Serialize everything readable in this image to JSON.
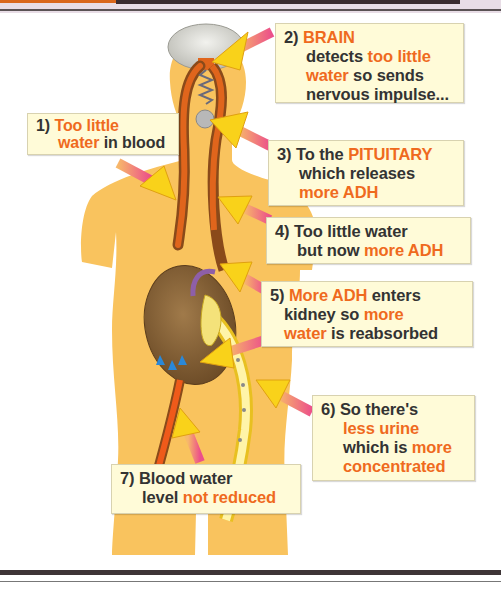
{
  "colors": {
    "highlight": "#ef6a1e",
    "body_fill": "#f9c35e",
    "box_bg": "#fffbd8",
    "text": "#333333",
    "blood_vessel": "#a0551e",
    "arrow_tail": "#ec5b8c",
    "arrow_head": "#f9d21a"
  },
  "steps": [
    {
      "number": "1)",
      "parts": [
        [
          "Too little",
          true
        ],
        [
          "water",
          true
        ],
        [
          " in blood",
          false
        ]
      ]
    },
    {
      "number": "2)",
      "heading": "BRAIN",
      "line1a": "detects ",
      "line1b": "too little",
      "line2a": "water",
      "line2b": " so sends",
      "line3": "nervous impulse..."
    },
    {
      "number": "3)",
      "line1a": "To the ",
      "line1b": "PITUITARY",
      "line2": "which releases",
      "line3": "more ADH"
    },
    {
      "number": "4)",
      "line1": "Too little water",
      "line2a": "but now ",
      "line2b": "more ADH"
    },
    {
      "number": "5)",
      "line1a": "More ADH",
      "line1b": " enters",
      "line2a": "kidney so ",
      "line2b": "more",
      "line3a": "water",
      "line3b": " is reabsorbed"
    },
    {
      "number": "6)",
      "line1": "So there's",
      "line2": "less urine",
      "line3a": "which is ",
      "line3b": "more",
      "line4": "concentrated"
    },
    {
      "number": "7)",
      "line1": "Blood water",
      "line2a": "level ",
      "line2b": "not reduced"
    }
  ],
  "labels": {
    "step1_l1_num": "1)",
    "step1_l1": "Too little",
    "step1_l2a": "water",
    "step1_l2b": " in blood"
  },
  "organs": [
    "brain",
    "pituitary",
    "kidney",
    "ureter",
    "blood-vessels"
  ]
}
